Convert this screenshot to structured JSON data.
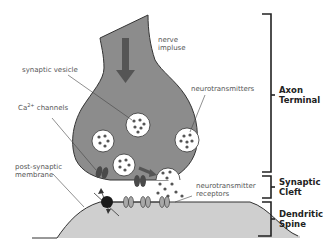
{
  "diagram": {
    "labels": {
      "nerve_impulse_line1": "nerve",
      "nerve_impulse_line2": "impluse",
      "synaptic_vesicle": "synaptic vesicle",
      "neurotransmitters": "neurotransmitters",
      "ca_channels_prefix": "Ca",
      "ca_channels_sup": "2+",
      "ca_channels_suffix": " channels",
      "post_synaptic_line1": "post-synaptic",
      "post_synaptic_line2": "membrane",
      "nt_receptors_line1": "neurotransmitter",
      "nt_receptors_line2": "receptors"
    },
    "sections": [
      {
        "line1": "Axon",
        "line2": "Terminal"
      },
      {
        "line1": "Synaptic",
        "line2": "Cleft"
      },
      {
        "line1": "Dendritic",
        "line2": "Spine"
      }
    ],
    "colors": {
      "axon_fill": "#8c8c8c",
      "spine_fill": "#cfcfcf",
      "outline": "#333333",
      "vesicle_fill": "#ffffff",
      "dot": "#555555",
      "channel": "#4a4a4a",
      "receptor": "#a8a8a8",
      "pump": "#1a1a1a",
      "arrow": "#555555"
    }
  }
}
